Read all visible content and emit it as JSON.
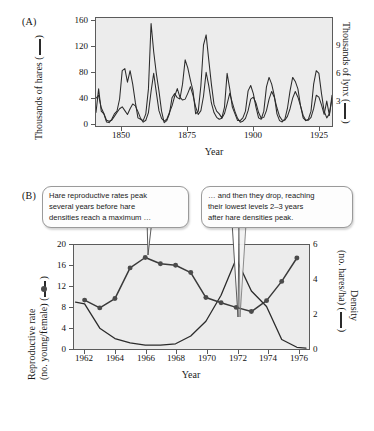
{
  "figure": {
    "panels": [
      {
        "label": "(A)",
        "xlabel": "Year",
        "y_left_title": "Thousands of hares",
        "y_right_title": "Thousands of lynx",
        "y_left_ticks": [
          "0",
          "40",
          "80",
          "120",
          "160"
        ],
        "y_right_ticks": [
          "3",
          "6",
          "9"
        ],
        "x_ticks": [
          "1850",
          "1875",
          "1900",
          "1925"
        ]
      },
      {
        "label": "(B)",
        "xlabel": "Year",
        "y_left_title_line1": "Reproductive rate",
        "y_left_title_line2": "(no. young/female)",
        "y_right_title_line1": "Density",
        "y_right_title_line2": "(no. hares/ha)",
        "y_left_ticks": [
          "0",
          "4",
          "8",
          "12",
          "16",
          "20"
        ],
        "y_right_ticks": [
          "0",
          "2",
          "4",
          "6"
        ],
        "x_ticks": [
          "1962",
          "1964",
          "1966",
          "1968",
          "1970",
          "1972",
          "1974",
          "1976"
        ]
      }
    ],
    "callouts": [
      {
        "id": "callout-left",
        "line1": "Hare reproductive rates peak",
        "line2": "several years before hare",
        "line3": "densities reach a maximum …"
      },
      {
        "id": "callout-right",
        "line1": "… and then they drop, reaching",
        "line2": "their lowest levels 2–3 years",
        "line3": "after hare densities peak."
      }
    ],
    "colors": {
      "plot_background": "#ececec",
      "axis": "#5b5b5b",
      "line": "#2b2b2b",
      "marker": "#4b4b4b",
      "callout_border": "#9a9a9a"
    }
  },
  "chart_data": [
    {
      "type": "line",
      "id": "panel-a",
      "title": "",
      "xlabel": "Year",
      "ylabel": "Thousands of hares",
      "ylabel_right": "Thousands of lynx",
      "xlim": [
        1845,
        1935
      ],
      "ylim": [
        0,
        160
      ],
      "ylim_right": [
        0,
        11.25
      ],
      "yticks": [
        0,
        40,
        80,
        120,
        160
      ],
      "yticks_right": [
        3,
        6,
        9
      ],
      "xticks": [
        1850,
        1875,
        1900,
        1925
      ],
      "grid": false,
      "legend": "none",
      "series": [
        {
          "name": "Hares",
          "axis": "left",
          "x": [
            1845,
            1846,
            1847,
            1848,
            1849,
            1850,
            1851,
            1852,
            1853,
            1854,
            1855,
            1856,
            1857,
            1858,
            1859,
            1860,
            1861,
            1862,
            1863,
            1864,
            1865,
            1866,
            1867,
            1868,
            1869,
            1870,
            1871,
            1872,
            1873,
            1874,
            1875,
            1876,
            1877,
            1878,
            1879,
            1880,
            1881,
            1882,
            1883,
            1884,
            1885,
            1886,
            1887,
            1888,
            1889,
            1890,
            1891,
            1892,
            1893,
            1894,
            1895,
            1896,
            1897,
            1898,
            1899,
            1900,
            1901,
            1902,
            1903,
            1904,
            1905,
            1906,
            1907,
            1908,
            1909,
            1910,
            1911,
            1912,
            1913,
            1914,
            1915,
            1916,
            1917,
            1918,
            1919,
            1920,
            1921,
            1922,
            1923,
            1924,
            1925,
            1926,
            1927,
            1928,
            1929,
            1930,
            1931,
            1932,
            1933,
            1934,
            1935
          ],
          "values": [
            20,
            55,
            22,
            18,
            6,
            5,
            10,
            18,
            22,
            40,
            82,
            85,
            65,
            82,
            62,
            35,
            12,
            10,
            8,
            18,
            55,
            152,
            110,
            78,
            52,
            22,
            5,
            8,
            18,
            42,
            48,
            42,
            40,
            62,
            98,
            86,
            68,
            52,
            18,
            22,
            60,
            120,
            135,
            98,
            62,
            32,
            22,
            18,
            12,
            28,
            78,
            55,
            28,
            18,
            8,
            8,
            12,
            22,
            52,
            60,
            48,
            28,
            12,
            10,
            22,
            58,
            72,
            62,
            45,
            18,
            8,
            6,
            10,
            26,
            52,
            72,
            66,
            55,
            30,
            12,
            8,
            10,
            22,
            62,
            82,
            78,
            48,
            22,
            12,
            18,
            40
          ]
        },
        {
          "name": "Lynx",
          "axis": "right",
          "x": [
            1845,
            1846,
            1847,
            1848,
            1849,
            1850,
            1851,
            1852,
            1853,
            1854,
            1855,
            1856,
            1857,
            1858,
            1859,
            1860,
            1861,
            1862,
            1863,
            1864,
            1865,
            1866,
            1867,
            1868,
            1869,
            1870,
            1871,
            1872,
            1873,
            1874,
            1875,
            1876,
            1877,
            1878,
            1879,
            1880,
            1881,
            1882,
            1883,
            1884,
            1885,
            1886,
            1887,
            1888,
            1889,
            1890,
            1891,
            1892,
            1893,
            1894,
            1895,
            1896,
            1897,
            1898,
            1899,
            1900,
            1901,
            1902,
            1903,
            1904,
            1905,
            1906,
            1907,
            1908,
            1909,
            1910,
            1911,
            1912,
            1913,
            1914,
            1915,
            1916,
            1917,
            1918,
            1919,
            1920,
            1921,
            1922,
            1923,
            1924,
            1925,
            1926,
            1927,
            1928,
            1929,
            1930,
            1931,
            1932,
            1933,
            1934,
            1935
          ],
          "values": [
            2.9,
            3.2,
            1.9,
            1.3,
            0.6,
            0.5,
            0.6,
            1.0,
            1.4,
            1.8,
            2.0,
            1.6,
            1.2,
            1.8,
            2.3,
            2.1,
            1.5,
            0.8,
            0.4,
            0.6,
            1.4,
            3.6,
            5.5,
            3.5,
            1.6,
            0.8,
            0.5,
            0.7,
            1.4,
            2.1,
            3.1,
            3.9,
            3.0,
            2.7,
            2.8,
            3.4,
            4.1,
            3.2,
            2.0,
            1.2,
            1.6,
            3.1,
            5.6,
            4.2,
            2.4,
            1.4,
            0.9,
            0.7,
            0.8,
            1.3,
            2.3,
            3.4,
            2.4,
            1.5,
            0.8,
            0.4,
            0.5,
            0.8,
            1.6,
            2.8,
            3.0,
            2.4,
            1.4,
            0.8,
            0.9,
            1.6,
            2.8,
            3.6,
            3.0,
            1.9,
            1.0,
            0.6,
            0.6,
            1.0,
            1.8,
            2.9,
            3.6,
            3.0,
            2.1,
            1.1,
            0.6,
            0.6,
            0.9,
            1.8,
            3.2,
            3.0,
            2.2,
            1.2,
            2.6,
            1.1,
            3.2
          ]
        }
      ]
    },
    {
      "type": "line",
      "id": "panel-b",
      "title": "",
      "xlabel": "Year",
      "ylabel": "Reproductive rate (no. young/female)",
      "ylabel_right": "Density (no. hares/ha)",
      "xlim": [
        1961.3,
        1976.8
      ],
      "ylim": [
        0,
        20
      ],
      "ylim_right": [
        0,
        6
      ],
      "yticks": [
        0,
        4,
        8,
        12,
        16,
        20
      ],
      "yticks_right": [
        0,
        2,
        4,
        6
      ],
      "xticks": [
        1962,
        1964,
        1966,
        1968,
        1970,
        1972,
        1974,
        1976
      ],
      "grid": false,
      "legend": "none",
      "series": [
        {
          "name": "Reproductive rate (no. young/female)",
          "axis": "left",
          "markers": true,
          "x": [
            1962,
            1963,
            1964,
            1965,
            1966,
            1967,
            1968,
            1969,
            1970,
            1971,
            1972,
            1973,
            1974,
            1975,
            1976
          ],
          "values": [
            9.4,
            7.9,
            9.7,
            15.6,
            17.6,
            16.4,
            16.1,
            14.7,
            9.9,
            8.9,
            8.0,
            7.2,
            9.3,
            13.0,
            17.5
          ]
        },
        {
          "name": "Density (no. hares/ha)",
          "axis": "right",
          "markers": false,
          "x": [
            1961.4,
            1962,
            1963,
            1964,
            1965,
            1966,
            1967,
            1968,
            1969,
            1970,
            1971,
            1972,
            1973,
            1974,
            1975,
            1976,
            1976.6
          ],
          "values": [
            2.7,
            2.6,
            1.2,
            0.6,
            0.35,
            0.22,
            0.22,
            0.3,
            0.75,
            1.6,
            3.1,
            5.2,
            3.35,
            2.45,
            0.55,
            0.1,
            0.05
          ]
        }
      ]
    }
  ]
}
